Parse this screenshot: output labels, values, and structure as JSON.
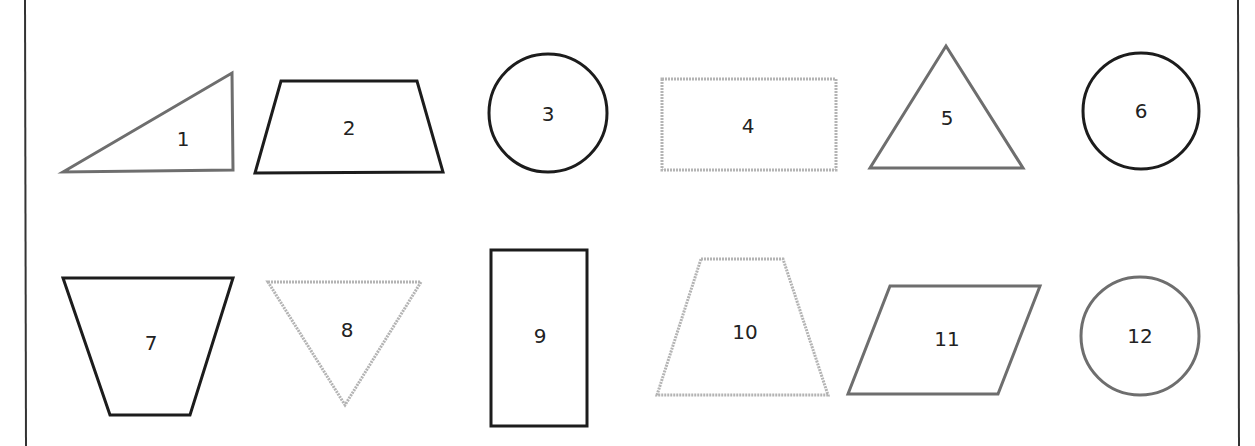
{
  "colors": {
    "black": "#1c1c1c",
    "grey": "#6e6e6e",
    "light_grey": "#b4b4b4",
    "frame": "#333333"
  },
  "shapes": [
    {
      "label": "1",
      "type": "right-triangle",
      "stroke": "grey"
    },
    {
      "label": "2",
      "type": "trapezoid",
      "stroke": "black"
    },
    {
      "label": "3",
      "type": "circle",
      "stroke": "black"
    },
    {
      "label": "4",
      "type": "rectangle",
      "stroke": "light-grey-dotted"
    },
    {
      "label": "5",
      "type": "triangle",
      "stroke": "grey"
    },
    {
      "label": "6",
      "type": "circle",
      "stroke": "black"
    },
    {
      "label": "7",
      "type": "inverted-trapezoid",
      "stroke": "black"
    },
    {
      "label": "8",
      "type": "inverted-triangle",
      "stroke": "light-grey-dotted"
    },
    {
      "label": "9",
      "type": "rectangle",
      "stroke": "black"
    },
    {
      "label": "10",
      "type": "trapezoid",
      "stroke": "light-grey-dotted"
    },
    {
      "label": "11",
      "type": "parallelogram",
      "stroke": "grey"
    },
    {
      "label": "12",
      "type": "circle",
      "stroke": "grey"
    }
  ]
}
